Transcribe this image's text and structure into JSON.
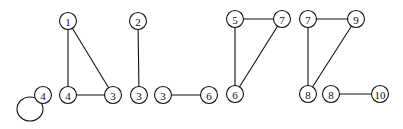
{
  "diagram": {
    "type": "graph-components",
    "node_radius": 8.5,
    "colors": {
      "stroke": "#111111",
      "fill": "#ffffff"
    },
    "nodes": [
      {
        "id": "a1",
        "label": "1",
        "x": 68,
        "y": 21
      },
      {
        "id": "a4",
        "label": "4",
        "x": 68,
        "y": 95
      },
      {
        "id": "a3",
        "label": "3",
        "x": 113,
        "y": 95
      },
      {
        "id": "loop4",
        "label": "4",
        "x": 43,
        "y": 95
      },
      {
        "id": "b2",
        "label": "2",
        "x": 138,
        "y": 21
      },
      {
        "id": "b3",
        "label": "3",
        "x": 139,
        "y": 95
      },
      {
        "id": "c3",
        "label": "3",
        "x": 163,
        "y": 95
      },
      {
        "id": "c6",
        "label": "6",
        "x": 209,
        "y": 95
      },
      {
        "id": "d5",
        "label": "5",
        "x": 235,
        "y": 19
      },
      {
        "id": "d7",
        "label": "7",
        "x": 282,
        "y": 19
      },
      {
        "id": "d6",
        "label": "6",
        "x": 235,
        "y": 94
      },
      {
        "id": "e7",
        "label": "7",
        "x": 308,
        "y": 19
      },
      {
        "id": "e9",
        "label": "9",
        "x": 356,
        "y": 19
      },
      {
        "id": "e8",
        "label": "8",
        "x": 308,
        "y": 94
      },
      {
        "id": "f8",
        "label": "8",
        "x": 331,
        "y": 94
      },
      {
        "id": "f10",
        "label": "10",
        "x": 380,
        "y": 94
      }
    ],
    "edges": [
      {
        "from": "a1",
        "to": "a4"
      },
      {
        "from": "a1",
        "to": "a3"
      },
      {
        "from": "a4",
        "to": "a3"
      },
      {
        "from": "b2",
        "to": "b3"
      },
      {
        "from": "c3",
        "to": "c6"
      },
      {
        "from": "d5",
        "to": "d7"
      },
      {
        "from": "d5",
        "to": "d6"
      },
      {
        "from": "d7",
        "to": "d6"
      },
      {
        "from": "e7",
        "to": "e9"
      },
      {
        "from": "e7",
        "to": "e8"
      },
      {
        "from": "e9",
        "to": "e8"
      },
      {
        "from": "f8",
        "to": "f10"
      }
    ],
    "self_loops": [
      {
        "node": "loop4",
        "cx": 30,
        "cy": 109,
        "rx": 13,
        "ry": 12
      }
    ]
  }
}
